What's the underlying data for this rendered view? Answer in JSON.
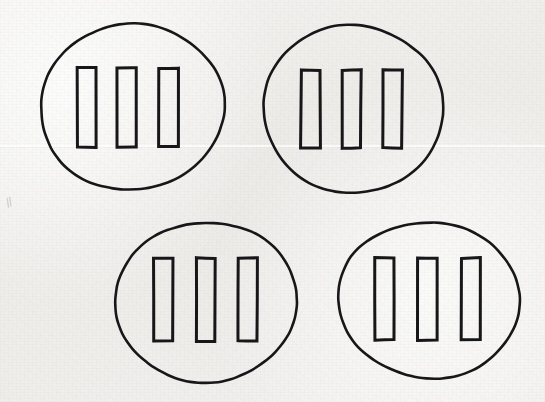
{
  "figure": {
    "medium": "scanned paper drawing",
    "width": 545,
    "height": 402,
    "background_color": "#f1f0ee",
    "ink_color": "#17171a",
    "group_count": 4,
    "bars_per_group": 3,
    "total_bars": 12
  },
  "paper": {
    "crease": {
      "y": 145,
      "note": "faint horizontal fold line across sheet"
    },
    "smudge": {
      "x": 6,
      "y": 196,
      "mark": "//"
    }
  },
  "groups": [
    {
      "id": "group-top-left",
      "label": "Top-left group",
      "position": "top-left",
      "circle": {
        "cx": 132,
        "cy": 107,
        "rx": 92,
        "ry": 83,
        "rotation": -6
      },
      "bar_count": 3,
      "bars": [
        {
          "id": "bar-1",
          "x": 77,
          "y": 68,
          "width": 19,
          "height": 79
        },
        {
          "id": "bar-2",
          "x": 117,
          "y": 68,
          "width": 19,
          "height": 79
        },
        {
          "id": "bar-3",
          "x": 159,
          "y": 68,
          "width": 19,
          "height": 79
        }
      ]
    },
    {
      "id": "group-top-right",
      "label": "Top-right group",
      "position": "top-right",
      "circle": {
        "cx": 353,
        "cy": 109,
        "rx": 90,
        "ry": 84,
        "rotation": 4
      },
      "bar_count": 3,
      "bars": [
        {
          "id": "bar-1",
          "x": 301,
          "y": 70,
          "width": 19,
          "height": 78
        },
        {
          "id": "bar-2",
          "x": 342,
          "y": 70,
          "width": 19,
          "height": 78
        },
        {
          "id": "bar-3",
          "x": 383,
          "y": 70,
          "width": 19,
          "height": 78
        }
      ]
    },
    {
      "id": "group-bottom-left",
      "label": "Bottom-left group",
      "position": "bottom-left",
      "circle": {
        "cx": 206,
        "cy": 302,
        "rx": 91,
        "ry": 80,
        "rotation": -3
      },
      "bar_count": 3,
      "bars": [
        {
          "id": "bar-1",
          "x": 154,
          "y": 258,
          "width": 19,
          "height": 83
        },
        {
          "id": "bar-2",
          "x": 196,
          "y": 258,
          "width": 19,
          "height": 83
        },
        {
          "id": "bar-3",
          "x": 238,
          "y": 258,
          "width": 19,
          "height": 83
        }
      ]
    },
    {
      "id": "group-bottom-right",
      "label": "Bottom-right group",
      "position": "bottom-right",
      "circle": {
        "cx": 429,
        "cy": 300,
        "rx": 91,
        "ry": 78,
        "rotation": 5
      },
      "bar_count": 3,
      "bars": [
        {
          "id": "bar-1",
          "x": 375,
          "y": 258,
          "width": 19,
          "height": 82
        },
        {
          "id": "bar-2",
          "x": 418,
          "y": 258,
          "width": 19,
          "height": 82
        },
        {
          "id": "bar-3",
          "x": 461,
          "y": 258,
          "width": 19,
          "height": 82
        }
      ]
    }
  ]
}
